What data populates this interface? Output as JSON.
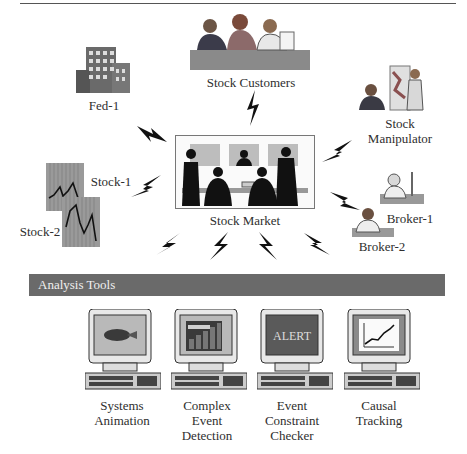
{
  "diagram": {
    "nodes": {
      "stock_customers": {
        "label": "Stock Customers"
      },
      "fed": {
        "label": "Fed-1"
      },
      "stock_manipulator": {
        "label_line1": "Stock",
        "label_line2": "Manipulator"
      },
      "stock1": {
        "label": "Stock-1"
      },
      "stock2": {
        "label": "Stock-2"
      },
      "stock_market": {
        "label": "Stock Market"
      },
      "broker1": {
        "label": "Broker-1"
      },
      "broker2": {
        "label": "Broker-2"
      }
    },
    "analysis_bar": {
      "title": "Analysis Tools"
    },
    "tools": [
      {
        "line1": "Systems",
        "line2": "Animation",
        "line3": "",
        "screen": "animation"
      },
      {
        "line1": "Complex",
        "line2": "Event",
        "line3": "Detection",
        "screen": "bar-chart"
      },
      {
        "line1": "Event",
        "line2": "Constraint",
        "line3": "Checker",
        "screen": "alert",
        "screen_text": "ALERT"
      },
      {
        "line1": "Causal",
        "line2": "Tracking",
        "line3": "",
        "screen": "line-chart"
      }
    ],
    "colors": {
      "bar": "#6a6a6a",
      "monitor_screen": "#b9b9b9",
      "alert_screen": "#5a5a5a",
      "bolt": "#111111"
    }
  }
}
